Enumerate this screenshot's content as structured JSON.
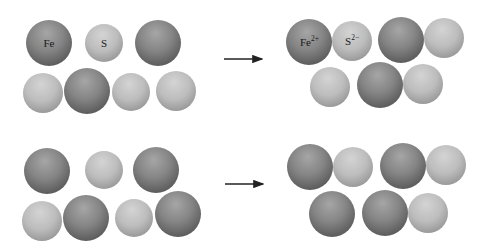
{
  "colors": {
    "background": "#ffffff",
    "iron_sphere": "#828282",
    "sulfur_sphere": "#bcbcbc",
    "arrow": "#222222",
    "label": "#1a1a1a"
  },
  "panels": [
    {
      "name": "top-reactants",
      "spheres": [
        {
          "cx": 49,
          "cy": 43,
          "r": 23,
          "kind": "iron",
          "label": "Fe"
        },
        {
          "cx": 104,
          "cy": 43,
          "r": 19,
          "kind": "sulfur",
          "label": "S"
        },
        {
          "cx": 158,
          "cy": 43,
          "r": 23,
          "kind": "iron"
        },
        {
          "cx": 43,
          "cy": 93,
          "r": 20,
          "kind": "sulfur"
        },
        {
          "cx": 87,
          "cy": 91,
          "r": 23,
          "kind": "iron"
        },
        {
          "cx": 131,
          "cy": 92,
          "r": 19,
          "kind": "sulfur"
        },
        {
          "cx": 176,
          "cy": 91,
          "r": 20,
          "kind": "sulfur"
        }
      ]
    },
    {
      "name": "top-products",
      "spheres": [
        {
          "cx": 309,
          "cy": 42,
          "r": 23,
          "kind": "iron",
          "label": "Fe",
          "superscript": "2+"
        },
        {
          "cx": 352,
          "cy": 41,
          "r": 20,
          "kind": "sulfur",
          "label": "S",
          "superscript": "2−"
        },
        {
          "cx": 401,
          "cy": 40,
          "r": 23,
          "kind": "iron"
        },
        {
          "cx": 444,
          "cy": 38,
          "r": 20,
          "kind": "sulfur"
        },
        {
          "cx": 330,
          "cy": 87,
          "r": 20,
          "kind": "sulfur"
        },
        {
          "cx": 380,
          "cy": 85,
          "r": 23,
          "kind": "iron"
        },
        {
          "cx": 423,
          "cy": 84,
          "r": 20,
          "kind": "sulfur"
        }
      ]
    },
    {
      "name": "bottom-reactants",
      "spheres": [
        {
          "cx": 47,
          "cy": 171,
          "r": 23,
          "kind": "iron"
        },
        {
          "cx": 104,
          "cy": 170,
          "r": 19,
          "kind": "sulfur"
        },
        {
          "cx": 156,
          "cy": 170,
          "r": 23,
          "kind": "iron"
        },
        {
          "cx": 42,
          "cy": 221,
          "r": 20,
          "kind": "sulfur"
        },
        {
          "cx": 86,
          "cy": 218,
          "r": 23,
          "kind": "iron"
        },
        {
          "cx": 134,
          "cy": 218,
          "r": 19,
          "kind": "sulfur"
        },
        {
          "cx": 178,
          "cy": 214,
          "r": 23,
          "kind": "iron"
        }
      ]
    },
    {
      "name": "bottom-products",
      "spheres": [
        {
          "cx": 310,
          "cy": 167,
          "r": 23,
          "kind": "iron"
        },
        {
          "cx": 353,
          "cy": 167,
          "r": 20,
          "kind": "sulfur"
        },
        {
          "cx": 403,
          "cy": 166,
          "r": 23,
          "kind": "iron"
        },
        {
          "cx": 446,
          "cy": 165,
          "r": 20,
          "kind": "sulfur"
        },
        {
          "cx": 332,
          "cy": 214,
          "r": 23,
          "kind": "iron"
        },
        {
          "cx": 385,
          "cy": 213,
          "r": 23,
          "kind": "iron"
        },
        {
          "cx": 428,
          "cy": 213,
          "r": 20,
          "kind": "sulfur"
        }
      ]
    }
  ],
  "arrows": [
    {
      "name": "top-reaction-arrow",
      "x1": 224,
      "x2": 263,
      "y": 59
    },
    {
      "name": "bottom-reaction-arrow",
      "x1": 225,
      "x2": 264,
      "y": 184
    }
  ],
  "labels": {
    "fe_atom": "Fe",
    "s_atom": "S",
    "fe_ion": "Fe",
    "fe_ion_charge": "2+",
    "s_ion": "S",
    "s_ion_charge": "2−"
  }
}
